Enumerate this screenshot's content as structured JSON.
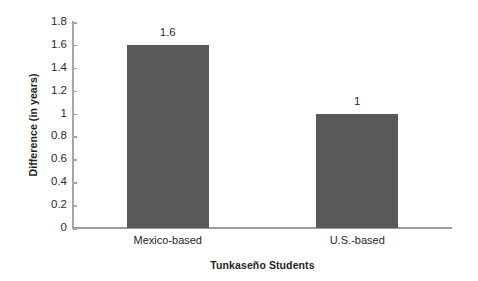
{
  "chart_data": {
    "type": "bar",
    "title": "",
    "xlabel": "Tunkaseño Students",
    "ylabel": "Difference (in years)",
    "categories": [
      "Mexico-based",
      "U.S.-based"
    ],
    "values": [
      1.6,
      1
    ],
    "value_labels": [
      "1.6",
      "1"
    ],
    "ylim": [
      0,
      1.8
    ],
    "ytick_labels": [
      "0",
      "0.2",
      "0.4",
      "0.6",
      "0.8",
      "1",
      "1.2",
      "1.4",
      "1.6",
      "1.8"
    ],
    "ytick_values": [
      0,
      0.2,
      0.4,
      0.6,
      0.8,
      1,
      1.2,
      1.4,
      1.6,
      1.8
    ],
    "grid": false,
    "legend": false,
    "legend_position": "none",
    "series": [
      {
        "name": "Difference (in years)",
        "values": [
          1.6,
          1
        ],
        "color": "#595959"
      }
    ],
    "colors": {
      "bar": "#595959",
      "axis": "#a6a6a6",
      "text": "#2b2b2b",
      "background": "#ffffff"
    }
  }
}
